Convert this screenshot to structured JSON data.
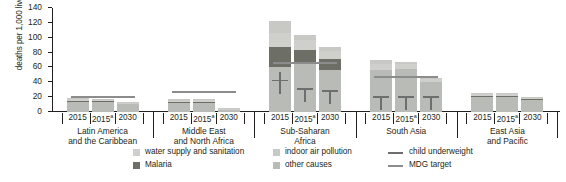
{
  "chart_data": {
    "type": "bar",
    "subtype": "grouped-stacked-bar",
    "title": "",
    "xlabel": "",
    "ylabel": "deaths per 1,000 live births",
    "ylim": [
      0,
      140
    ],
    "yticks": [
      0,
      20,
      40,
      60,
      80,
      100,
      120,
      140
    ],
    "grid": false,
    "legend_position": "bottom",
    "stack_order_bottom_to_top": [
      "other causes",
      "Malaria",
      "water supply and sanitation",
      "indoor air pollution"
    ],
    "categories": [
      "Latin America and the Caribbean",
      "Middle East and North Africa",
      "Sub-Saharan Africa",
      "South Asia",
      "East Asia and Pacific"
    ],
    "subcategories": [
      "2015",
      "2015a",
      "2030"
    ],
    "series": [
      {
        "name": "other causes",
        "color": "#b9bbb6",
        "values": [
          [
            14.0,
            13.0,
            10.5
          ],
          [
            12.0,
            12.5,
            3.5
          ],
          [
            60.0,
            68.0,
            57.0
          ],
          [
            56.0,
            58.0,
            41.0
          ],
          [
            20.0,
            20.0,
            16.0
          ]
        ]
      },
      {
        "name": "Malaria",
        "color": "#6d6e66",
        "values": [
          [
            1.5,
            1.2,
            1.0
          ],
          [
            1.5,
            1.5,
            0.5
          ],
          [
            28.0,
            16.0,
            15.0
          ],
          [
            0.0,
            0.0,
            0.0
          ],
          [
            1.5,
            1.5,
            1.0
          ]
        ]
      },
      {
        "name": "water supply and sanitation",
        "color": "#cfd0cb",
        "values": [
          [
            2.0,
            2.0,
            1.0
          ],
          [
            2.0,
            2.0,
            0.7
          ],
          [
            18.0,
            13.0,
            10.0
          ],
          [
            9.0,
            7.0,
            4.0
          ],
          [
            3.0,
            3.0,
            2.0
          ]
        ]
      },
      {
        "name": "indoor air pollution",
        "color": "#c8c9c4",
        "values": [
          [
            1.5,
            1.0,
            0.5
          ],
          [
            1.5,
            1.0,
            0.3
          ],
          [
            17.0,
            7.0,
            6.0
          ],
          [
            5.0,
            3.0,
            1.0
          ],
          [
            1.5,
            1.5,
            1.0
          ]
        ]
      }
    ],
    "totals": [
      [
        19,
        17,
        13
      ],
      [
        17,
        17,
        5
      ],
      [
        123,
        104,
        88
      ],
      [
        70,
        68,
        46
      ],
      [
        26,
        26,
        20
      ]
    ],
    "overlays": [
      {
        "name": "child underweight",
        "color": "#6e6e6e",
        "type": "marker",
        "values": [
          [
            null,
            null,
            null
          ],
          [
            null,
            null,
            null
          ],
          [
            42,
            31,
            28
          ],
          [
            20,
            20,
            20
          ],
          [
            null,
            null,
            null
          ]
        ]
      },
      {
        "name": "MDG target",
        "color": "#8c8c8c",
        "type": "line",
        "values": [
          19,
          25,
          65,
          46,
          null
        ]
      }
    ]
  },
  "axis": {
    "y_title": "deaths per 1,000 live births",
    "y_tick_labels": [
      "140",
      "120",
      "100",
      "80",
      "60",
      "40",
      "20",
      "0"
    ]
  },
  "groups": [
    {
      "label_line1": "Latin America",
      "label_line2": "and the Caribbean",
      "bars": [
        {
          "tick": "2015"
        },
        {
          "tick": "2015",
          "note": "a"
        },
        {
          "tick": "2030"
        }
      ]
    },
    {
      "label_line1": "Middle East",
      "label_line2": "and North Africa",
      "bars": [
        {
          "tick": "2015"
        },
        {
          "tick": "2015",
          "note": "a"
        },
        {
          "tick": "2030"
        }
      ]
    },
    {
      "label_line1": "Sub-Saharan",
      "label_line2": "Africa",
      "bars": [
        {
          "tick": "2015"
        },
        {
          "tick": "2015",
          "note": "a"
        },
        {
          "tick": "2030"
        }
      ]
    },
    {
      "label_line1": "South Asia",
      "label_line2": "",
      "bars": [
        {
          "tick": "2015"
        },
        {
          "tick": "2015",
          "note": "a"
        },
        {
          "tick": "2030"
        }
      ]
    },
    {
      "label_line1": "East Asia",
      "label_line2": "and Pacific",
      "bars": [
        {
          "tick": "2015"
        },
        {
          "tick": "2015",
          "note": "a"
        },
        {
          "tick": "2030"
        }
      ]
    }
  ],
  "legend": {
    "items": [
      {
        "label": "water supply and sanitation",
        "color": "#cfd0cb",
        "kind": "swatch"
      },
      {
        "label": "Malaria",
        "color": "#6d6e66",
        "kind": "swatch"
      },
      {
        "label": "indoor air pollution",
        "color": "#c8c9c4",
        "kind": "swatch"
      },
      {
        "label": "other causes",
        "color": "#b9bbb6",
        "kind": "swatch"
      },
      {
        "label": "child underweight",
        "color": "#6e6e6e",
        "kind": "line"
      },
      {
        "label": "MDG target",
        "color": "#8c8c8c",
        "kind": "line"
      }
    ]
  }
}
